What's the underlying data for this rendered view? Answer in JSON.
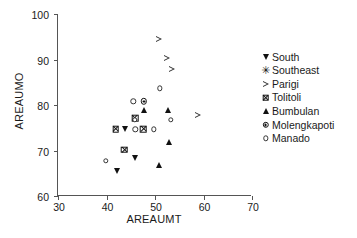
{
  "chart_data": {
    "type": "scatter",
    "title": "",
    "xlabel": "AREAUMT",
    "ylabel": "AREAUMO",
    "xlim": [
      30,
      70
    ],
    "ylim": [
      60,
      100
    ],
    "xticks": [
      30,
      40,
      50,
      60,
      70
    ],
    "yticks": [
      60,
      70,
      80,
      90,
      100
    ],
    "grid": false,
    "legend_position": "right",
    "series": [
      {
        "name": "South",
        "marker": "filled-down-triangle",
        "color": "#111111",
        "points": [
          {
            "x": 42.1,
            "y": 65.6
          },
          {
            "x": 43.9,
            "y": 74.7
          },
          {
            "x": 45.8,
            "y": 68.4
          }
        ]
      },
      {
        "name": "Southeast",
        "marker": "asterisk",
        "color": "#111111",
        "points": []
      },
      {
        "name": "Parigi",
        "marker": "open-right-triangle",
        "color": "#333333",
        "points": [
          {
            "x": 50.9,
            "y": 94.6
          },
          {
            "x": 52.5,
            "y": 90.4
          },
          {
            "x": 53.6,
            "y": 88.0
          },
          {
            "x": 58.8,
            "y": 77.7
          }
        ]
      },
      {
        "name": "Tolitoli",
        "marker": "crossed-square",
        "color": "#111111",
        "points": [
          {
            "x": 41.9,
            "y": 74.7
          },
          {
            "x": 43.7,
            "y": 70.2
          },
          {
            "x": 45.9,
            "y": 77.1
          },
          {
            "x": 47.6,
            "y": 74.7
          }
        ]
      },
      {
        "name": "Bumbulan",
        "marker": "filled-up-triangle",
        "color": "#111111",
        "points": [
          {
            "x": 47.7,
            "y": 78.9
          },
          {
            "x": 50.8,
            "y": 66.8
          },
          {
            "x": 52.7,
            "y": 78.8
          },
          {
            "x": 52.8,
            "y": 71.9
          }
        ]
      },
      {
        "name": "Molengkapoti",
        "marker": "dotted-circle",
        "color": "#111111",
        "points": [
          {
            "x": 47.7,
            "y": 80.8
          }
        ]
      },
      {
        "name": "Manado",
        "marker": "open-circle",
        "color": "#333333",
        "points": [
          {
            "x": 39.8,
            "y": 67.7
          },
          {
            "x": 45.5,
            "y": 80.8
          },
          {
            "x": 45.8,
            "y": 76.8
          },
          {
            "x": 45.9,
            "y": 74.7
          },
          {
            "x": 49.8,
            "y": 74.7
          },
          {
            "x": 51.0,
            "y": 83.7
          },
          {
            "x": 53.3,
            "y": 76.7
          }
        ]
      }
    ]
  },
  "legend": {
    "items": [
      {
        "label": "South",
        "marker": "filled-down-triangle"
      },
      {
        "label": "Southeast",
        "marker": "asterisk"
      },
      {
        "label": "Parigi",
        "marker": "open-right-triangle"
      },
      {
        "label": "Tolitoli",
        "marker": "crossed-square"
      },
      {
        "label": "Bumbulan",
        "marker": "filled-up-triangle"
      },
      {
        "label": "Molengkapoti",
        "marker": "dotted-circle"
      },
      {
        "label": "Manado",
        "marker": "open-circle"
      }
    ]
  },
  "glyphs": {
    "asterisk": "✳"
  }
}
